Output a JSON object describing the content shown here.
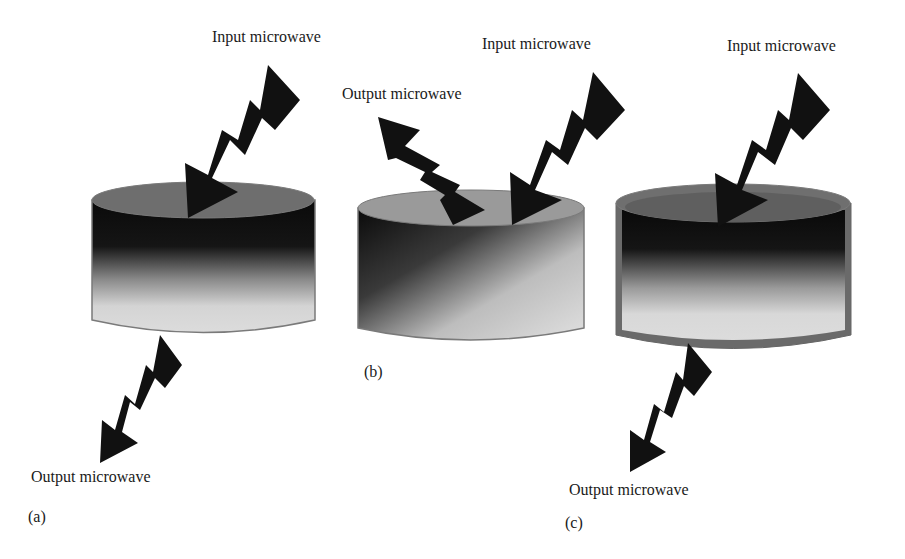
{
  "figure": {
    "panels": [
      {
        "id": "a",
        "caption": "(a)",
        "input_label": "Input microwave",
        "output_label": "Output microwave",
        "description": "Input microwave enters top, output microwave exits bottom (transmission)"
      },
      {
        "id": "b",
        "caption": "(b)",
        "input_label": "Input microwave",
        "output_label": "Output microwave",
        "description": "Input microwave enters top, output microwave reflected from top"
      },
      {
        "id": "c",
        "caption": "(c)",
        "input_label": "Input microwave",
        "output_label": "Output microwave",
        "description": "Input microwave enters top, output exits bottom through coated cylinder"
      }
    ]
  }
}
